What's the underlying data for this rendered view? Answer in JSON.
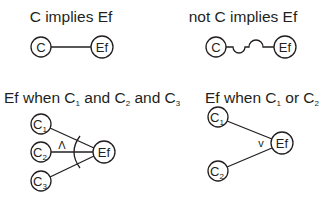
{
  "panels": [
    {
      "id": "c-implies-ef",
      "title": "C implies Ef",
      "nodes": [
        {
          "label": "C",
          "sub": ""
        },
        {
          "label": "Ef",
          "sub": ""
        }
      ],
      "edge": "straight"
    },
    {
      "id": "not-c-implies-ef",
      "title": "not C implies Ef",
      "nodes": [
        {
          "label": "C",
          "sub": ""
        },
        {
          "label": "Ef",
          "sub": ""
        }
      ],
      "edge": "negation-wave"
    },
    {
      "id": "and",
      "title_parts": [
        "Ef when C",
        "1",
        " and C",
        "2",
        " and C",
        "3"
      ],
      "nodes": [
        {
          "label": "C",
          "sub": "1"
        },
        {
          "label": "C",
          "sub": "2"
        },
        {
          "label": "C",
          "sub": "3"
        },
        {
          "label": "Ef",
          "sub": ""
        }
      ],
      "operator": "Λ"
    },
    {
      "id": "or",
      "title_parts": [
        "Ef when C",
        "1",
        " or C",
        "2"
      ],
      "nodes": [
        {
          "label": "C",
          "sub": "1"
        },
        {
          "label": "C",
          "sub": "2"
        },
        {
          "label": "Ef",
          "sub": ""
        }
      ],
      "operator": "v"
    }
  ],
  "colors": {
    "ink": "#231f20",
    "background": "#ffffff"
  }
}
